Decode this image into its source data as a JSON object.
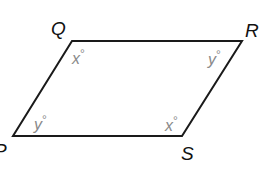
{
  "figure": {
    "type": "parallelogram",
    "stroke_color": "#1a1a1a",
    "label_color": "#111111",
    "angle_label_color": "#8a8a8a",
    "vertices": {
      "Q": {
        "label": "Q",
        "x": 72,
        "y": 41
      },
      "R": {
        "label": "R",
        "x": 242,
        "y": 41
      },
      "S": {
        "label": "S",
        "x": 182,
        "y": 136
      },
      "P": {
        "label": "P",
        "x": 13,
        "y": 136
      }
    },
    "angles": {
      "Q": {
        "variable": "x",
        "degree": "°"
      },
      "R": {
        "variable": "y",
        "degree": "°"
      },
      "S": {
        "variable": "x",
        "degree": "°"
      },
      "P": {
        "variable": "y",
        "degree": "°"
      }
    }
  }
}
